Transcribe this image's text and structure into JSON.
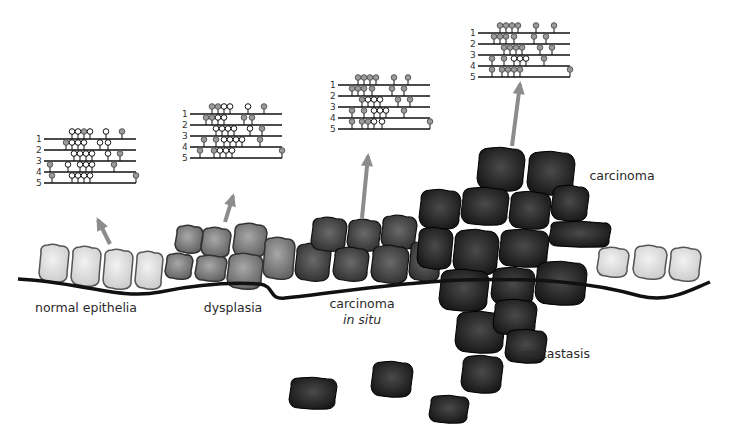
{
  "colors": {
    "normal_cell": "#d6d6d6",
    "dysplasia_cell": "#7a7a7a",
    "cis_cell": "#3e3e3e",
    "carcinoma_cell": "#1a1a1a",
    "arrow": "#8c8c8c",
    "methylated": "#9a9a9a",
    "unmethylated": "#ffffff",
    "membrane": "#111111"
  },
  "stages": [
    {
      "name": "normal epithelia",
      "label": "normal epithelia",
      "panel": {
        "x": 36,
        "y": 128,
        "rows": [
          {
            "num": "1",
            "sites": [
              {
                "x": 28,
                "m": false
              },
              {
                "x": 34,
                "m": false
              },
              {
                "x": 40,
                "m": true
              },
              {
                "x": 46,
                "m": false
              },
              {
                "x": 62,
                "m": false
              },
              {
                "x": 78,
                "m": true
              }
            ]
          },
          {
            "num": "2",
            "sites": [
              {
                "x": 22,
                "m": true
              },
              {
                "x": 28,
                "m": false
              },
              {
                "x": 34,
                "m": false
              },
              {
                "x": 40,
                "m": false
              },
              {
                "x": 56,
                "m": false
              },
              {
                "x": 64,
                "m": false
              }
            ]
          },
          {
            "num": "3",
            "sites": [
              {
                "x": 30,
                "m": false
              },
              {
                "x": 36,
                "m": false
              },
              {
                "x": 42,
                "m": false
              },
              {
                "x": 48,
                "m": false
              },
              {
                "x": 64,
                "m": false
              },
              {
                "x": 76,
                "m": true
              }
            ]
          },
          {
            "num": "4",
            "sites": [
              {
                "x": 6,
                "m": true
              },
              {
                "x": 24,
                "m": false
              },
              {
                "x": 36,
                "m": false
              },
              {
                "x": 42,
                "m": false
              },
              {
                "x": 48,
                "m": false
              },
              {
                "x": 70,
                "m": true
              }
            ]
          },
          {
            "num": "5",
            "sites": [
              {
                "x": 8,
                "m": true
              },
              {
                "x": 28,
                "m": false
              },
              {
                "x": 34,
                "m": false
              },
              {
                "x": 40,
                "m": false
              },
              {
                "x": 46,
                "m": false
              },
              {
                "x": 92,
                "m": true
              }
            ]
          }
        ]
      }
    },
    {
      "name": "dysplasia",
      "label": "dysplasia",
      "panel": {
        "x": 182,
        "y": 103,
        "rows": [
          {
            "num": "1",
            "sites": [
              {
                "x": 22,
                "m": true
              },
              {
                "x": 28,
                "m": true
              },
              {
                "x": 34,
                "m": false
              },
              {
                "x": 40,
                "m": false
              },
              {
                "x": 58,
                "m": false
              },
              {
                "x": 74,
                "m": true
              }
            ]
          },
          {
            "num": "2",
            "sites": [
              {
                "x": 16,
                "m": true
              },
              {
                "x": 22,
                "m": true
              },
              {
                "x": 28,
                "m": false
              },
              {
                "x": 34,
                "m": false
              },
              {
                "x": 54,
                "m": true
              },
              {
                "x": 62,
                "m": true
              }
            ]
          },
          {
            "num": "3",
            "sites": [
              {
                "x": 26,
                "m": false
              },
              {
                "x": 32,
                "m": false
              },
              {
                "x": 38,
                "m": false
              },
              {
                "x": 44,
                "m": false
              },
              {
                "x": 60,
                "m": false
              },
              {
                "x": 72,
                "m": true
              }
            ]
          },
          {
            "num": "4",
            "sites": [
              {
                "x": 14,
                "m": true
              },
              {
                "x": 26,
                "m": true
              },
              {
                "x": 34,
                "m": false
              },
              {
                "x": 40,
                "m": false
              },
              {
                "x": 46,
                "m": false
              },
              {
                "x": 52,
                "m": false
              },
              {
                "x": 70,
                "m": true
              }
            ]
          },
          {
            "num": "5",
            "sites": [
              {
                "x": 10,
                "m": true
              },
              {
                "x": 24,
                "m": true
              },
              {
                "x": 30,
                "m": false
              },
              {
                "x": 36,
                "m": false
              },
              {
                "x": 42,
                "m": false
              },
              {
                "x": 92,
                "m": true
              }
            ]
          }
        ]
      }
    },
    {
      "name": "carcinoma in situ",
      "label": "carcinoma",
      "label_italic": "in situ",
      "panel": {
        "x": 330,
        "y": 74,
        "rows": [
          {
            "num": "1",
            "sites": [
              {
                "x": 20,
                "m": true
              },
              {
                "x": 26,
                "m": true
              },
              {
                "x": 32,
                "m": true
              },
              {
                "x": 38,
                "m": true
              },
              {
                "x": 56,
                "m": true
              },
              {
                "x": 70,
                "m": true
              }
            ]
          },
          {
            "num": "2",
            "sites": [
              {
                "x": 14,
                "m": true
              },
              {
                "x": 20,
                "m": true
              },
              {
                "x": 26,
                "m": true
              },
              {
                "x": 34,
                "m": true
              },
              {
                "x": 54,
                "m": true
              },
              {
                "x": 66,
                "m": true
              }
            ]
          },
          {
            "num": "3",
            "sites": [
              {
                "x": 24,
                "m": true
              },
              {
                "x": 30,
                "m": false
              },
              {
                "x": 36,
                "m": false
              },
              {
                "x": 42,
                "m": false
              },
              {
                "x": 60,
                "m": true
              },
              {
                "x": 72,
                "m": true
              }
            ]
          },
          {
            "num": "4",
            "sites": [
              {
                "x": 14,
                "m": true
              },
              {
                "x": 26,
                "m": true
              },
              {
                "x": 36,
                "m": false
              },
              {
                "x": 42,
                "m": false
              },
              {
                "x": 48,
                "m": false
              },
              {
                "x": 66,
                "m": true
              }
            ]
          },
          {
            "num": "5",
            "sites": [
              {
                "x": 14,
                "m": true
              },
              {
                "x": 24,
                "m": true
              },
              {
                "x": 30,
                "m": true
              },
              {
                "x": 36,
                "m": false
              },
              {
                "x": 44,
                "m": false
              },
              {
                "x": 92,
                "m": true
              }
            ]
          }
        ]
      }
    },
    {
      "name": "carcinoma",
      "label": "carcinoma",
      "panel": {
        "x": 470,
        "y": 22,
        "rows": [
          {
            "num": "1",
            "sites": [
              {
                "x": 22,
                "m": true
              },
              {
                "x": 28,
                "m": true
              },
              {
                "x": 34,
                "m": true
              },
              {
                "x": 40,
                "m": true
              },
              {
                "x": 58,
                "m": true
              },
              {
                "x": 76,
                "m": true
              }
            ]
          },
          {
            "num": "2",
            "sites": [
              {
                "x": 16,
                "m": true
              },
              {
                "x": 22,
                "m": true
              },
              {
                "x": 28,
                "m": true
              },
              {
                "x": 36,
                "m": true
              },
              {
                "x": 56,
                "m": true
              },
              {
                "x": 68,
                "m": true
              }
            ]
          },
          {
            "num": "3",
            "sites": [
              {
                "x": 26,
                "m": true
              },
              {
                "x": 32,
                "m": true
              },
              {
                "x": 38,
                "m": true
              },
              {
                "x": 44,
                "m": true
              },
              {
                "x": 62,
                "m": true
              },
              {
                "x": 74,
                "m": true
              }
            ]
          },
          {
            "num": "4",
            "sites": [
              {
                "x": 14,
                "m": true
              },
              {
                "x": 26,
                "m": true
              },
              {
                "x": 36,
                "m": false
              },
              {
                "x": 42,
                "m": false
              },
              {
                "x": 48,
                "m": false
              },
              {
                "x": 66,
                "m": true
              }
            ]
          },
          {
            "num": "5",
            "sites": [
              {
                "x": 14,
                "m": true
              },
              {
                "x": 24,
                "m": true
              },
              {
                "x": 30,
                "m": true
              },
              {
                "x": 36,
                "m": true
              },
              {
                "x": 42,
                "m": true
              },
              {
                "x": 92,
                "m": true
              }
            ]
          }
        ]
      }
    }
  ],
  "labels": {
    "normal": "normal epithelia",
    "dysplasia": "dysplasia",
    "cis_line1": "carcinoma",
    "cis_line2": "in situ",
    "carcinoma": "carcinoma",
    "metastasis": "metastasis"
  }
}
